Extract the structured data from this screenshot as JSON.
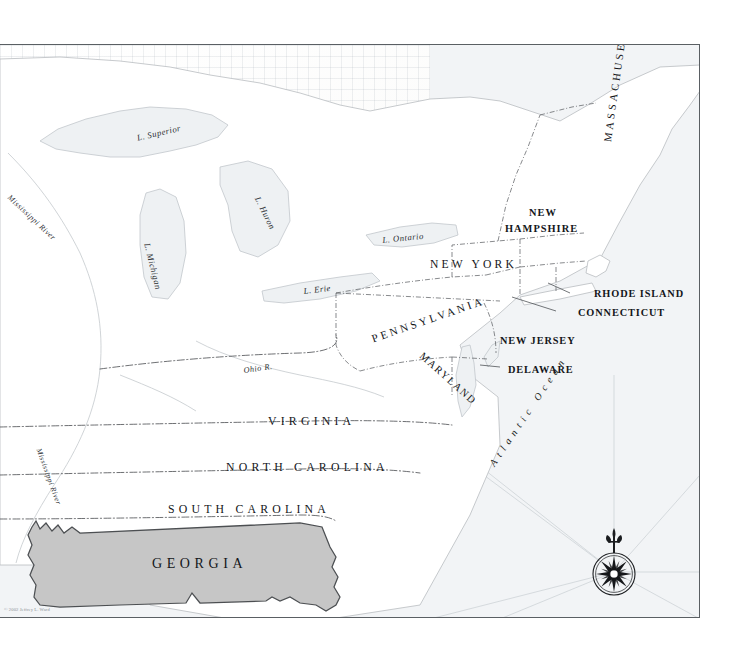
{
  "map": {
    "title": "The Thirteen Colonies — Eastern North America",
    "highlighted_region": "GEORGIA",
    "credit": "© 2002 Jeffrey L. Ward",
    "colors": {
      "paper": "#fdfdfd",
      "highlight_fill": "#c6c6c6",
      "highlight_stroke": "#4c4f52",
      "coastline": "#b9bdc0",
      "water": "#e9ecee",
      "border": "#5a5f63",
      "label": "#14161a"
    },
    "states": [
      {
        "name": "MASSACHUSETTS",
        "x": 602,
        "y": 96,
        "style": "vertical",
        "rotate": 82,
        "size": 10.6,
        "tracking": 3.0
      },
      {
        "name": "NEW",
        "x": 529,
        "y": 162,
        "style": "caps-sm",
        "rotate": 0,
        "size": 10.4,
        "tracking": 1.0
      },
      {
        "name": "HAMPSHIRE",
        "x": 505,
        "y": 178,
        "style": "caps-sm",
        "rotate": 0,
        "size": 10.4,
        "tracking": 1.0
      },
      {
        "name": "NEW YORK",
        "x": 430,
        "y": 213,
        "style": "spaced",
        "rotate": 0,
        "size": 11.6,
        "tracking": 3.2
      },
      {
        "name": "RHODE ISLAND",
        "x": 594,
        "y": 243,
        "style": "caps-sm",
        "rotate": 0,
        "size": 10.3,
        "tracking": 0.9
      },
      {
        "name": "CONNECTICUT",
        "x": 578,
        "y": 262,
        "style": "caps-sm",
        "rotate": 0,
        "size": 10.3,
        "tracking": 0.9
      },
      {
        "name": "PENNSYLVANIA",
        "x": 370,
        "y": 288,
        "style": "spaced",
        "rotate": -19,
        "size": 11.0,
        "tracking": 3.0
      },
      {
        "name": "NEW JERSEY",
        "x": 500,
        "y": 290,
        "style": "caps-sm",
        "rotate": 0,
        "size": 10.3,
        "tracking": 0.9
      },
      {
        "name": "MARYLAND",
        "x": 425,
        "y": 305,
        "style": "spaced",
        "rotate": 42,
        "size": 10.4,
        "tracking": 1.6
      },
      {
        "name": "DELAWARE",
        "x": 508,
        "y": 319,
        "style": "caps-sm",
        "rotate": 0,
        "size": 10.3,
        "tracking": 0.9
      },
      {
        "name": "VIRGINIA",
        "x": 268,
        "y": 369,
        "style": "spaced",
        "rotate": 0,
        "size": 11.8,
        "tracking": 4.2
      },
      {
        "name": "NORTH CAROLINA",
        "x": 226,
        "y": 415,
        "style": "spaced",
        "rotate": 0,
        "size": 11.8,
        "tracking": 4.2
      },
      {
        "name": "SOUTH CAROLINA",
        "x": 168,
        "y": 457,
        "style": "spaced",
        "rotate": 0,
        "size": 11.8,
        "tracking": 4.2
      },
      {
        "name": "GEORGIA",
        "x": 152,
        "y": 511,
        "style": "spaced",
        "rotate": 0,
        "size": 14.0,
        "tracking": 4.6
      }
    ],
    "water_labels": [
      {
        "name": "L. Superior",
        "x": 136,
        "y": 88,
        "rotate": -13,
        "size": 8.6
      },
      {
        "name": "L. Michigan",
        "x": 152,
        "y": 197,
        "rotate": 76,
        "size": 8.6
      },
      {
        "name": "L. Huron",
        "x": 262,
        "y": 150,
        "rotate": 64,
        "size": 8.6
      },
      {
        "name": "L. Ontario",
        "x": 382,
        "y": 190,
        "rotate": -6,
        "size": 8.6
      },
      {
        "name": "L. Erie",
        "x": 303,
        "y": 241,
        "rotate": -7,
        "size": 8.6
      },
      {
        "name": "Mississippi River",
        "x": 12,
        "y": 148,
        "rotate": 43,
        "size": 7.8
      },
      {
        "name": "Mississippi River",
        "x": 43,
        "y": 402,
        "rotate": 70,
        "size": 7.4
      },
      {
        "name": "Ohio R.",
        "x": 243,
        "y": 321,
        "rotate": -8,
        "size": 8.2
      }
    ],
    "ocean_label": {
      "name": "Atlantic Ocean",
      "x": 487,
      "y": 417,
      "rotate": -56
    },
    "compass": {
      "label": "compass-rose",
      "points": 16,
      "north_marker": "fleur-de-lis"
    }
  }
}
